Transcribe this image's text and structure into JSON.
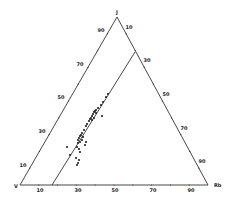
{
  "diagram": {
    "type": "ternary",
    "vertices": {
      "top": {
        "label": "J",
        "x": 117,
        "y": 17
      },
      "bottom_left": {
        "label": "V",
        "x": 20,
        "y": 185
      },
      "bottom_right": {
        "label": "Rb",
        "x": 208,
        "y": 185
      }
    },
    "tie_line": {
      "x1": 52,
      "y1": 185,
      "x2": 135,
      "y2": 52
    },
    "tick_labels": {
      "left": [
        {
          "text": "90",
          "x": 101,
          "y": 32
        },
        {
          "text": "70",
          "x": 80,
          "y": 66
        },
        {
          "text": "50",
          "x": 61,
          "y": 99
        },
        {
          "text": "30",
          "x": 42,
          "y": 133
        },
        {
          "text": "10",
          "x": 23,
          "y": 167
        }
      ],
      "right": [
        {
          "text": "10",
          "x": 129,
          "y": 29
        },
        {
          "text": "30",
          "x": 147,
          "y": 62
        },
        {
          "text": "50",
          "x": 166,
          "y": 96
        },
        {
          "text": "70",
          "x": 184,
          "y": 130
        },
        {
          "text": "90",
          "x": 202,
          "y": 163
        }
      ],
      "bottom": [
        {
          "text": "10",
          "x": 40,
          "y": 192
        },
        {
          "text": "30",
          "x": 78,
          "y": 192
        },
        {
          "text": "50",
          "x": 115,
          "y": 192
        },
        {
          "text": "70",
          "x": 153,
          "y": 192
        },
        {
          "text": "90",
          "x": 191,
          "y": 192
        }
      ]
    },
    "points": [
      [
        108,
        94
      ],
      [
        106,
        97
      ],
      [
        103,
        102
      ],
      [
        101,
        105
      ],
      [
        98,
        108
      ],
      [
        96,
        110
      ],
      [
        95,
        111
      ],
      [
        94,
        112
      ],
      [
        93,
        114
      ],
      [
        92,
        116
      ],
      [
        91,
        118
      ],
      [
        90,
        119
      ],
      [
        89,
        121
      ],
      [
        92,
        120
      ],
      [
        94,
        118
      ],
      [
        96,
        113
      ],
      [
        87,
        124
      ],
      [
        86,
        126
      ],
      [
        84,
        130
      ],
      [
        82,
        133
      ],
      [
        81,
        135
      ],
      [
        80,
        136
      ],
      [
        83,
        137
      ],
      [
        79,
        138
      ],
      [
        78,
        140
      ],
      [
        80,
        142
      ],
      [
        82,
        140
      ],
      [
        86,
        142
      ],
      [
        85,
        145
      ],
      [
        78,
        143
      ],
      [
        77,
        147
      ],
      [
        79,
        149
      ],
      [
        80,
        152
      ],
      [
        67,
        147
      ],
      [
        70,
        155
      ],
      [
        79,
        160
      ],
      [
        76,
        158
      ],
      [
        78,
        163
      ],
      [
        77,
        165
      ],
      [
        102,
        116
      ]
    ]
  }
}
